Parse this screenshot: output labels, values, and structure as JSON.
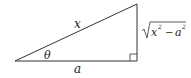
{
  "diagram": {
    "type": "right-triangle",
    "labels": {
      "hypotenuse": "x",
      "angle": "θ",
      "adjacent": "a",
      "opposite_radicand_x": "x",
      "opposite_radicand_minus": "−",
      "opposite_radicand_a": "a",
      "exponent": "2"
    },
    "opposite_expression": "√(x² − a²)",
    "colors": {
      "stroke": "#333333",
      "background": "#ffffff"
    }
  }
}
